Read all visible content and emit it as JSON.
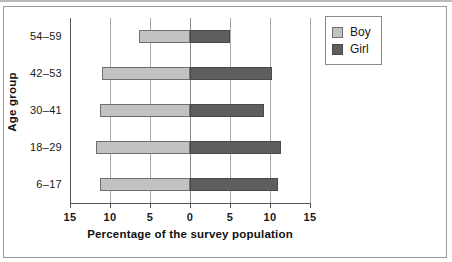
{
  "chart_data": {
    "type": "bar",
    "orientation": "horizontal",
    "style": "back-to-back population pyramid",
    "title": "",
    "xlabel": "Percentage of the survey population",
    "ylabel": "Age group",
    "categories": [
      "6–17",
      "18–29",
      "30–41",
      "42–53",
      "54–59"
    ],
    "category_order_top_to_bottom": [
      "54–59",
      "42–53",
      "30–41",
      "18–29",
      "6–17"
    ],
    "xtick_labels": [
      "15",
      "10",
      "5",
      "0",
      "5",
      "10",
      "15"
    ],
    "xtick_values": [
      -15,
      -10,
      -5,
      0,
      5,
      10,
      15
    ],
    "xlim": [
      -15,
      15
    ],
    "grid": true,
    "legend_position": "top-right",
    "series": [
      {
        "name": "Boy",
        "color": "#c2c2c2",
        "side": "left",
        "values": [
          11.2,
          11.8,
          11.3,
          11.0,
          6.4
        ]
      },
      {
        "name": "Girl",
        "color": "#5e5e5e",
        "side": "right",
        "values": [
          11.0,
          11.4,
          9.2,
          10.3,
          5.0
        ]
      }
    ]
  },
  "legend": {
    "items": [
      {
        "label": "Boy",
        "swatch": "boy"
      },
      {
        "label": "Girl",
        "swatch": "girl"
      }
    ]
  }
}
